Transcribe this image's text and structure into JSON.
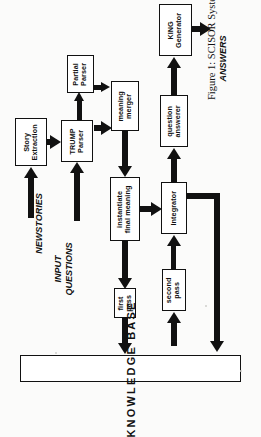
{
  "figure": {
    "caption": "Figure 1: SCISOR System Architecture",
    "orientation": "rotated-90-ccw",
    "ink_color": "#111111",
    "paper_color": "#fbfbfa"
  },
  "inputs": [
    {
      "id": "newstories",
      "label": "NEWSTORIES"
    },
    {
      "id": "input-questions",
      "label_line1": "INPUT",
      "label_line2": "QUESTIONS"
    }
  ],
  "outputs": [
    {
      "id": "answers",
      "label": "ANSWERS"
    }
  ],
  "nodes": [
    {
      "id": "story-extraction",
      "label": "Story\nExtraction"
    },
    {
      "id": "partial-parser",
      "label": "Partial\nParser"
    },
    {
      "id": "trump-parser",
      "label": "TRUMP\nParser"
    },
    {
      "id": "meaning-merger",
      "label": "meaning\nmerger"
    },
    {
      "id": "instantiate-final-meaning",
      "label": "instantiate\nfinal meaning"
    },
    {
      "id": "first-pass",
      "label": "first\npass"
    },
    {
      "id": "second-pass",
      "label": "second\npass"
    },
    {
      "id": "integrator",
      "label": "Integrator"
    },
    {
      "id": "question-answerer",
      "label": "question\nanswerer"
    },
    {
      "id": "king-generator",
      "label": "KING\nGenerator"
    }
  ],
  "knowledge_base": {
    "id": "knowledge-base",
    "label": "KNOWLEDGE BASE"
  },
  "edges": [
    {
      "from": "newstories",
      "to": "story-extraction"
    },
    {
      "from": "story-extraction",
      "to": "trump-parser"
    },
    {
      "from": "input-questions",
      "to": "trump-parser"
    },
    {
      "from": "trump-parser",
      "to": "partial-parser"
    },
    {
      "from": "trump-parser",
      "to": "meaning-merger"
    },
    {
      "from": "partial-parser",
      "to": "meaning-merger"
    },
    {
      "from": "meaning-merger",
      "to": "instantiate-final-meaning"
    },
    {
      "from": "instantiate-final-meaning",
      "to": "first-pass"
    },
    {
      "from": "instantiate-final-meaning",
      "to": "integrator"
    },
    {
      "from": "first-pass",
      "to": "knowledge-base"
    },
    {
      "from": "knowledge-base",
      "to": "second-pass"
    },
    {
      "from": "second-pass",
      "to": "integrator"
    },
    {
      "from": "integrator",
      "to": "knowledge-base"
    },
    {
      "from": "integrator",
      "to": "question-answerer"
    },
    {
      "from": "question-answerer",
      "to": "king-generator"
    },
    {
      "from": "king-generator",
      "to": "answers"
    }
  ]
}
